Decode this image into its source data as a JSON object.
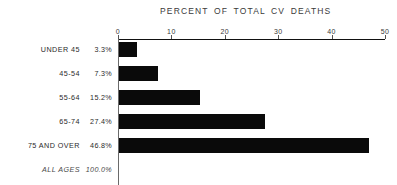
{
  "chart_data": {
    "type": "bar",
    "orientation": "horizontal",
    "title": "PERCENT OF TOTAL CV DEATHS",
    "xlabel": "",
    "ylabel": "",
    "xlim": [
      0,
      50
    ],
    "grid": false,
    "legend": "none",
    "xticks": [
      "0",
      "10",
      "20",
      "30",
      "40",
      "50"
    ],
    "xtick_values": [
      0,
      10,
      20,
      30,
      40,
      50
    ],
    "categories": [
      "UNDER 45",
      "45-54",
      "55-64",
      "65-74",
      "75 AND OVER"
    ],
    "values": [
      3.3,
      7.3,
      15.2,
      27.4,
      46.8
    ],
    "value_labels": [
      "3.3%",
      "7.3%",
      "15.2%",
      "27.4%",
      "46.8%"
    ],
    "rows": [
      {
        "category": "UNDER 45",
        "value": 3.3,
        "label": "3.3%",
        "total": false
      },
      {
        "category": "45-54",
        "value": 7.3,
        "label": "7.3%",
        "total": false
      },
      {
        "category": "55-64",
        "value": 15.2,
        "label": "15.2%",
        "total": false
      },
      {
        "category": "65-74",
        "value": 27.4,
        "label": "27.4%",
        "total": false
      },
      {
        "category": "75 AND OVER",
        "value": 46.8,
        "label": "46.8%",
        "total": false
      },
      {
        "category": "ALL AGES",
        "value": null,
        "label": "100.0%",
        "total": true
      }
    ],
    "bar_color": "#0a0a0a",
    "background_color": "#ffffff",
    "axis_color": "#111111"
  }
}
